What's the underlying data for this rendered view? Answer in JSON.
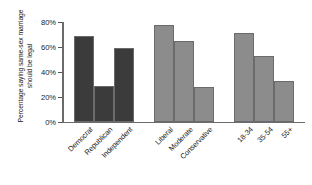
{
  "chart_data": {
    "type": "bar",
    "title": "",
    "subtitle": "",
    "xlabel": "",
    "ylabel": "Percentage saying same-sex marriage should be legal",
    "ylim": [
      0,
      80
    ],
    "grid": false,
    "legend_position": "none",
    "ytick_labels": [
      "0%",
      "20%",
      "40%",
      "60%",
      "80%"
    ],
    "ytick_values": [
      0,
      20,
      40,
      60,
      80
    ],
    "categories": [
      "Democrat",
      "Republican",
      "Independent",
      "Liberal",
      "Moderate",
      "Conservative",
      "18-34",
      "35-54",
      "55+"
    ],
    "values": [
      69,
      29,
      59,
      78,
      65,
      28,
      71,
      53,
      33
    ],
    "groups": [
      {
        "name": "Party",
        "color": "#3b3b3b",
        "categories": [
          "Democrat",
          "Republican",
          "Independent"
        ],
        "values": [
          69,
          29,
          59
        ]
      },
      {
        "name": "Ideology",
        "color": "#8c8c8c",
        "categories": [
          "Liberal",
          "Moderate",
          "Conservative"
        ],
        "values": [
          78,
          65,
          28
        ]
      },
      {
        "name": "Age",
        "color": "#8c8c8c",
        "categories": [
          "18-34",
          "35-54",
          "55+"
        ],
        "values": [
          71,
          53,
          33
        ]
      }
    ],
    "colors": {
      "group_party": "#3b3b3b",
      "group_ideology": "#8c8c8c",
      "group_age": "#8c8c8c",
      "bar_edge": "#6b6b6b",
      "axis": "#6b6b6b",
      "text": "#1a1a1a",
      "background": "#ffffff"
    }
  }
}
